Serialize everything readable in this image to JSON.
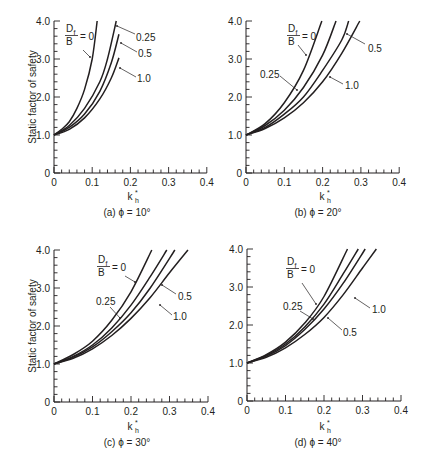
{
  "figure": {
    "ylabel": "Static factor of safety",
    "xlabel_main": "k",
    "xlabel_sub": "h",
    "xlabel_sup": "*",
    "ink_color": "#231f20",
    "background": "#ffffff"
  },
  "chart_data": [
    {
      "type": "line",
      "panel": "a",
      "title": "(a) ϕ = 10°",
      "xlabel": "k_h*",
      "ylabel": "Static factor of safety",
      "xlim": [
        0,
        0.4
      ],
      "ylim": [
        0,
        4.0
      ],
      "xticks": [
        "0",
        "0.1",
        "0.2",
        "0.3",
        "0.4"
      ],
      "yticks": [
        "0",
        "1.0",
        "2.0",
        "3.0",
        "4.0"
      ],
      "grid": false,
      "legend_title": "Df/B",
      "series": [
        {
          "name": "Df/B = 0",
          "x": [
            0,
            0.02,
            0.04,
            0.06,
            0.08,
            0.1,
            0.113
          ],
          "y": [
            1.0,
            1.15,
            1.35,
            1.7,
            2.2,
            3.0,
            4.0
          ]
        },
        {
          "name": "Df/B = 0.25",
          "x": [
            0,
            0.04,
            0.08,
            0.12,
            0.14,
            0.163
          ],
          "y": [
            1.0,
            1.25,
            1.7,
            2.4,
            3.0,
            4.0
          ]
        },
        {
          "name": "Df/B = 0.5",
          "x": [
            0,
            0.04,
            0.08,
            0.12,
            0.15,
            0.17
          ],
          "y": [
            1.0,
            1.2,
            1.55,
            2.15,
            2.9,
            3.65
          ]
        },
        {
          "name": "Df/B = 1.0",
          "x": [
            0,
            0.04,
            0.08,
            0.12,
            0.15,
            0.17
          ],
          "y": [
            1.0,
            1.15,
            1.45,
            1.95,
            2.5,
            3.03
          ]
        }
      ]
    },
    {
      "type": "line",
      "panel": "b",
      "title": "(b) ϕ = 20°",
      "xlabel": "k_h*",
      "ylabel": "",
      "xlim": [
        0,
        0.4
      ],
      "ylim": [
        0,
        4.0
      ],
      "xticks": [
        "0",
        "0.1",
        "0.2",
        "0.3",
        "0.4"
      ],
      "yticks": [
        "0",
        "1.0",
        "2.0",
        "3.0",
        "4.0"
      ],
      "grid": false,
      "legend_title": "Df/B",
      "series": [
        {
          "name": "Df/B = 0",
          "x": [
            0,
            0.05,
            0.1,
            0.15,
            0.198
          ],
          "y": [
            1.0,
            1.3,
            1.85,
            2.7,
            4.0
          ]
        },
        {
          "name": "Df/B = 0.25",
          "x": [
            0,
            0.05,
            0.1,
            0.15,
            0.2,
            0.235
          ],
          "y": [
            1.0,
            1.25,
            1.65,
            2.25,
            3.1,
            4.0
          ]
        },
        {
          "name": "Df/B = 0.5",
          "x": [
            0,
            0.05,
            0.1,
            0.15,
            0.2,
            0.25,
            0.268
          ],
          "y": [
            1.0,
            1.2,
            1.55,
            2.0,
            2.7,
            3.5,
            4.0
          ]
        },
        {
          "name": "Df/B = 1.0",
          "x": [
            0,
            0.05,
            0.1,
            0.15,
            0.2,
            0.25,
            0.297
          ],
          "y": [
            1.0,
            1.17,
            1.45,
            1.85,
            2.4,
            3.15,
            4.0
          ]
        }
      ]
    },
    {
      "type": "line",
      "panel": "c",
      "title": "(c) ϕ = 30°",
      "xlabel": "k_h*",
      "ylabel": "Static factor of safety",
      "xlim": [
        0,
        0.4
      ],
      "ylim": [
        0,
        4.0
      ],
      "xticks": [
        "0",
        "0.1",
        "0.2",
        "0.3",
        "0.4"
      ],
      "yticks": [
        "0",
        "1.0",
        "2.0",
        "3.0",
        "4.0"
      ],
      "grid": false,
      "legend_title": "Df/B",
      "series": [
        {
          "name": "Df/B = 0",
          "x": [
            0,
            0.05,
            0.1,
            0.15,
            0.2,
            0.254
          ],
          "y": [
            1.0,
            1.25,
            1.6,
            2.15,
            2.9,
            4.0
          ]
        },
        {
          "name": "Df/B = 0.25",
          "x": [
            0,
            0.05,
            0.1,
            0.15,
            0.2,
            0.25,
            0.293
          ],
          "y": [
            1.0,
            1.2,
            1.5,
            1.95,
            2.55,
            3.3,
            4.0
          ]
        },
        {
          "name": "Df/B = 0.5",
          "x": [
            0,
            0.05,
            0.1,
            0.15,
            0.2,
            0.25,
            0.314
          ],
          "y": [
            1.0,
            1.18,
            1.45,
            1.85,
            2.35,
            3.0,
            4.0
          ]
        },
        {
          "name": "Df/B = 1.0",
          "x": [
            0,
            0.05,
            0.1,
            0.15,
            0.2,
            0.25,
            0.3,
            0.348
          ],
          "y": [
            1.0,
            1.15,
            1.4,
            1.75,
            2.2,
            2.75,
            3.4,
            4.0
          ]
        }
      ]
    },
    {
      "type": "line",
      "panel": "d",
      "title": "(d) ϕ = 40°",
      "xlabel": "k_h*",
      "ylabel": "",
      "xlim": [
        0,
        0.4
      ],
      "ylim": [
        0,
        4.0
      ],
      "xticks": [
        "0",
        "0.1",
        "0.2",
        "0.3",
        "0.4"
      ],
      "yticks": [
        "0",
        "1.0",
        "2.0",
        "3.0",
        "4.0"
      ],
      "grid": false,
      "legend_title": "Df/B",
      "series": [
        {
          "name": "Df/B = 0",
          "x": [
            0,
            0.05,
            0.1,
            0.15,
            0.2,
            0.261
          ],
          "y": [
            1.0,
            1.22,
            1.55,
            2.05,
            2.75,
            4.0
          ]
        },
        {
          "name": "Df/B = 0.25",
          "x": [
            0,
            0.05,
            0.1,
            0.15,
            0.2,
            0.25,
            0.289
          ],
          "y": [
            1.0,
            1.2,
            1.5,
            1.95,
            2.55,
            3.35,
            4.0
          ]
        },
        {
          "name": "Df/B = 0.5",
          "x": [
            0,
            0.05,
            0.1,
            0.15,
            0.2,
            0.25,
            0.307
          ],
          "y": [
            1.0,
            1.18,
            1.46,
            1.88,
            2.42,
            3.1,
            4.0
          ]
        },
        {
          "name": "Df/B = 1.0",
          "x": [
            0,
            0.05,
            0.1,
            0.15,
            0.2,
            0.25,
            0.3,
            0.336
          ],
          "y": [
            1.0,
            1.15,
            1.4,
            1.75,
            2.2,
            2.8,
            3.5,
            4.0
          ]
        }
      ]
    }
  ],
  "panels": [
    {
      "id": "a",
      "origin": [
        54,
        173
      ],
      "xscale": 382,
      "yscale": 38,
      "show_ylabel": true,
      "ylabel_pos": [
        36,
        97
      ],
      "xlabel_pos": [
        130,
        200
      ],
      "caption_pos": [
        127,
        216
      ],
      "fraction": {
        "num": "D",
        "num_sub": "f",
        "den": "B",
        "eq": "= 0",
        "pos": [
          66,
          32
        ]
      },
      "annotations": [
        {
          "text": "",
          "line": [
            [
              83,
              50
            ],
            [
              90,
              57
            ]
          ]
        },
        {
          "text": "0.25",
          "pos": [
            136,
            41
          ],
          "line": [
            [
              135,
              34
            ],
            [
              117,
              26
            ]
          ]
        },
        {
          "text": "0.5",
          "pos": [
            138,
            57
          ],
          "line": [
            [
              137,
              52
            ],
            [
              121,
              43
            ]
          ]
        },
        {
          "text": "1.0",
          "pos": [
            137,
            82
          ],
          "line": [
            [
              136,
              77
            ],
            [
              120,
              68
            ]
          ]
        }
      ]
    },
    {
      "id": "b",
      "origin": [
        246,
        173
      ],
      "xscale": 383,
      "yscale": 38,
      "show_ylabel": false,
      "xlabel_pos": [
        322,
        200
      ],
      "caption_pos": [
        318,
        216
      ],
      "fraction": {
        "num": "D",
        "num_sub": "f",
        "den": "B",
        "eq": "= 0",
        "pos": [
          288,
          32
        ]
      },
      "annotations": [
        {
          "text": "",
          "line": [
            [
              298,
              45
            ],
            [
              306,
              55
            ]
          ]
        },
        {
          "text": "0.25",
          "pos": [
            260,
            78
          ],
          "line": [
            [
              280,
              76
            ],
            [
              297,
              90
            ]
          ]
        },
        {
          "text": "0.5",
          "pos": [
            368,
            52
          ],
          "line": [
            [
              365,
              44
            ],
            [
              347,
              34
            ]
          ]
        },
        {
          "text": "1.0",
          "pos": [
            345,
            89
          ],
          "line": [
            [
              343,
              84
            ],
            [
              330,
              77
            ]
          ]
        }
      ]
    },
    {
      "id": "c",
      "origin": [
        54,
        402
      ],
      "xscale": 385,
      "yscale": 38,
      "show_ylabel": true,
      "ylabel_pos": [
        36,
        326
      ],
      "xlabel_pos": [
        130,
        430
      ],
      "caption_pos": [
        127,
        446
      ],
      "fraction": {
        "num": "D",
        "num_sub": "f",
        "den": "B",
        "eq": "= 0",
        "pos": [
          98,
          263
        ]
      },
      "annotations": [
        {
          "text": "",
          "line": [
            [
              125,
              276
            ],
            [
              135,
              282
            ]
          ]
        },
        {
          "text": "0.25",
          "pos": [
            96,
            305
          ],
          "line": [
            [
              110,
              307
            ],
            [
              120,
              318
            ]
          ]
        },
        {
          "text": "0.5",
          "pos": [
            178,
            300
          ],
          "line": [
            [
              176,
              294
            ],
            [
              162,
              285
            ]
          ]
        },
        {
          "text": "1.0",
          "pos": [
            173,
            320
          ],
          "line": [
            [
              172,
              315
            ],
            [
              160,
              305
            ]
          ]
        }
      ]
    },
    {
      "id": "d",
      "origin": [
        247,
        401
      ],
      "xscale": 385,
      "yscale": 38,
      "show_ylabel": false,
      "xlabel_pos": [
        322,
        430
      ],
      "caption_pos": [
        318,
        446
      ],
      "fraction": {
        "num": "D",
        "num_sub": "f",
        "den": "B",
        "eq": "= 0",
        "pos": [
          287,
          265
        ]
      },
      "annotations": [
        {
          "text": "",
          "line": [
            [
              302,
              283
            ],
            [
              316,
              304
            ]
          ]
        },
        {
          "text": "0.25",
          "pos": [
            283,
            310
          ],
          "line": [
            [
              300,
              311
            ],
            [
              313,
              319
            ]
          ]
        },
        {
          "text": "0.5",
          "pos": [
            343,
            336
          ],
          "line": [
            [
              342,
              330
            ],
            [
              328,
              318
            ]
          ]
        },
        {
          "text": "1.0",
          "pos": [
            372,
            313
          ],
          "line": [
            [
              370,
              308
            ],
            [
              355,
              298
            ]
          ]
        }
      ]
    }
  ]
}
